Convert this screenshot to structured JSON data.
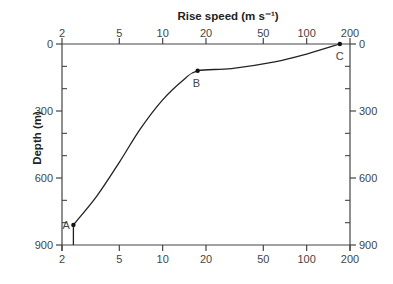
{
  "chart_data": {
    "type": "line",
    "title": "",
    "xlabel": "Rise speed (m s⁻¹)",
    "ylabel": "Depth (m)",
    "x_scale": "log",
    "xlim": [
      2,
      200
    ],
    "ylim": [
      900,
      0
    ],
    "y_inverted": true,
    "grid": false,
    "x_ticks": [
      2,
      5,
      10,
      20,
      50,
      100,
      200
    ],
    "x_tick_labels": [
      "2",
      "5",
      "10",
      "20",
      "50",
      "100",
      "200"
    ],
    "y_ticks": [
      0,
      300,
      600,
      900
    ],
    "y_tick_labels": [
      "0",
      "300",
      "600",
      "900"
    ],
    "y_minor_ticks": [
      100,
      200,
      400,
      500,
      700,
      800
    ],
    "x_axis_top_and_bottom": true,
    "y_axis_left_and_right": true,
    "series": [
      {
        "name": "rise-speed-profile",
        "points": [
          {
            "x": 2.4,
            "y": 900
          },
          {
            "x": 2.4,
            "y": 810
          },
          {
            "x": 3.5,
            "y": 680
          },
          {
            "x": 5.0,
            "y": 530
          },
          {
            "x": 7.0,
            "y": 380
          },
          {
            "x": 10.0,
            "y": 250
          },
          {
            "x": 14.0,
            "y": 160
          },
          {
            "x": 17.5,
            "y": 120
          },
          {
            "x": 30.0,
            "y": 110
          },
          {
            "x": 60.0,
            "y": 80
          },
          {
            "x": 100.0,
            "y": 45
          },
          {
            "x": 170.0,
            "y": 0
          }
        ]
      }
    ],
    "annotations": [
      {
        "label": "A",
        "x": 2.4,
        "y": 810
      },
      {
        "label": "B",
        "x": 17.5,
        "y": 120
      },
      {
        "label": "C",
        "x": 170,
        "y": 0
      }
    ]
  },
  "labels": {
    "x_title": "Rise speed (m s⁻¹)",
    "y_title": "Depth (m)",
    "point_a": "A",
    "point_b": "B",
    "point_c": "C"
  }
}
